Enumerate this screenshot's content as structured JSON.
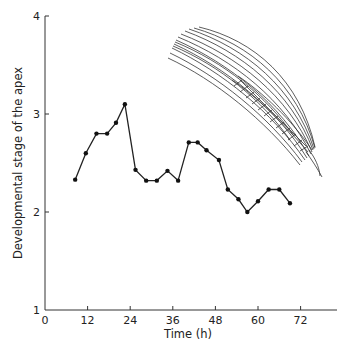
{
  "chart_data": {
    "type": "line",
    "title": "",
    "xlabel": "Time (h)",
    "ylabel": "Developmental stage of the apex",
    "xlim": [
      0,
      82
    ],
    "ylim": [
      1,
      4
    ],
    "xticks": [
      0,
      12,
      24,
      36,
      48,
      60,
      72
    ],
    "yticks": [
      1,
      2,
      3,
      4
    ],
    "grid": false,
    "legend": null,
    "annotations": [
      "Illustration of a wheat ear (spike with awns) in upper right"
    ],
    "series": [
      {
        "name": "Apex developmental stage",
        "x": [
          8.5,
          11.5,
          14.5,
          17.5,
          20,
          22.5,
          25.5,
          28.5,
          31.5,
          34.5,
          37.5,
          40.5,
          43,
          45.5,
          49,
          51.5,
          54.5,
          57,
          60,
          63,
          66,
          69
        ],
        "values": [
          2.33,
          2.6,
          2.8,
          2.8,
          2.91,
          3.1,
          2.43,
          2.32,
          2.32,
          2.42,
          2.32,
          2.71,
          2.71,
          2.63,
          2.53,
          2.23,
          2.13,
          2.0,
          2.11,
          2.23,
          2.23,
          2.09
        ],
        "color": "#111111",
        "marker": "circle"
      }
    ]
  }
}
